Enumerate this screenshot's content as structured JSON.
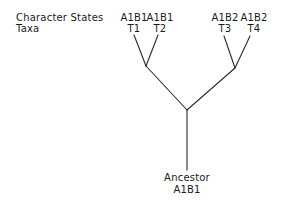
{
  "row_labels": {
    "character_states": "Character States",
    "taxa": "Taxa"
  },
  "taxa": [
    {
      "state": "A1B1",
      "name": "T1"
    },
    {
      "state": "A1B1",
      "name": "T2"
    },
    {
      "state": "A1B2",
      "name": "T3"
    },
    {
      "state": "A1B2",
      "name": "T4"
    }
  ],
  "ancestor": {
    "label": "Ancestor",
    "state": "A1B1"
  },
  "colors": {
    "line": "#2a2a2a",
    "text": "#1a1a1a",
    "background": "#ffffff"
  }
}
